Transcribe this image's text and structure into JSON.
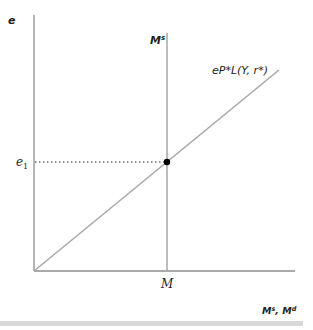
{
  "diagram": {
    "title": "",
    "type": "money market equilibrium",
    "y_axis": {
      "label": "e"
    },
    "x_axis": {
      "label_main_1": "M",
      "label_sup_1": "s",
      "label_sep": ", ",
      "label_main_2": "M",
      "label_sup_2": "d"
    },
    "supply_curve": {
      "label_main": "M",
      "label_sup": "s",
      "x_tick_label": "M"
    },
    "demand_curve": {
      "label": "eP*L(Y, r*)"
    },
    "equilibrium": {
      "y_tick_label_main": "e",
      "y_tick_label_sub": "1"
    },
    "colors": {
      "axis": "#8c8c8c",
      "curve": "#a6a6a6",
      "text": "#231f20",
      "dot": "#000000",
      "bar": "#d9d9d9"
    }
  }
}
